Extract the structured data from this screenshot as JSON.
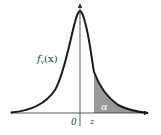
{
  "diagram": {
    "curve_label": "f_v(x)",
    "curve_label_main": "f",
    "curve_label_sub": "v",
    "curve_label_arg": "(x)",
    "origin_label": "0",
    "critical_label": "z",
    "area_label": "α",
    "colors": {
      "curve": "#1a1a1a",
      "axis": "#333333",
      "shaded_area": "#999999",
      "area_label": "#ffffff"
    }
  }
}
